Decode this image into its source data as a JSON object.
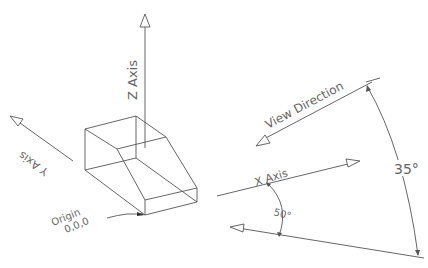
{
  "diagram": {
    "type": "technical-projection",
    "labels": {
      "z_axis": "Z Axis",
      "y_axis": "Y Axis",
      "x_axis": "X Axis",
      "view_direction": "View Direction",
      "origin_line1": "Origin",
      "origin_line2": "0,0,0",
      "angle_small": "50°",
      "angle_large": "35°"
    },
    "colors": {
      "line": "#555555",
      "text": "#666666",
      "background": "#ffffff"
    }
  }
}
